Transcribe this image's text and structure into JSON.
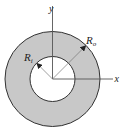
{
  "diagram": {
    "axes": {
      "x_label": "x",
      "y_label": "y"
    },
    "radii": {
      "inner": {
        "symbol": "R",
        "subscript": "i"
      },
      "outer": {
        "symbol": "R",
        "subscript": "o"
      }
    },
    "colors": {
      "ring_fill": "#c8c8c8",
      "hole_fill": "#ffffff",
      "stroke": "#333333",
      "axis": "#555555"
    }
  }
}
